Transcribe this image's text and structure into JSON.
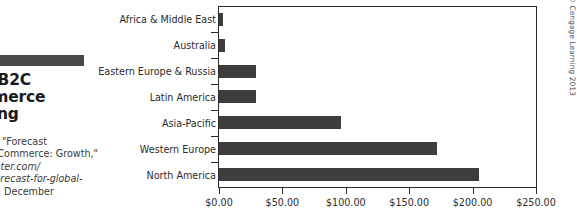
{
  "caption": {
    "title": "Global B2C\nE-Commerce Spending",
    "title_visible": "al B2C\nending",
    "source_line1": "Source data: \"Forecast",
    "source_line2": "for Global E-Commerce: Growth,\"",
    "source_line3": "www.emarketer.com/",
    "source_line4": "newsroom/forecast-for-global-",
    "source_line5": "e-commerce, December",
    "source_line6": "2011.",
    "source_visible": "data: \"Forecast\nerce: Growth,\"\nerce.com/\nst-for-global-\n, December\n."
  },
  "copyright": "© Cengage Learning 2013",
  "colors": {
    "bar": "#3d3d3d",
    "axis": "#2b2b2b",
    "rule": "#4a4a4a",
    "text": "#2b2b2b",
    "background": "#ffffff"
  },
  "chart_data": {
    "type": "bar",
    "orientation": "horizontal",
    "title": "Global B2C E-Commerce Spending",
    "xlabel": "",
    "ylabel": "",
    "xlim": [
      0,
      250
    ],
    "grid": false,
    "legend": false,
    "categories": [
      "Africa & Middle East",
      "Australia",
      "Eastern Europe & Russia",
      "Latin America",
      "Asia-Pacific",
      "Western Europe",
      "North America"
    ],
    "values": [
      3,
      5,
      29,
      29,
      96,
      172,
      205
    ],
    "xticks": [
      0,
      50,
      100,
      150,
      200,
      250
    ],
    "xticklabels": [
      "$0.00",
      "$50.00",
      "$100.00",
      "$150.00",
      "$200.00",
      "$250.00"
    ],
    "value_units": "billions USD"
  }
}
